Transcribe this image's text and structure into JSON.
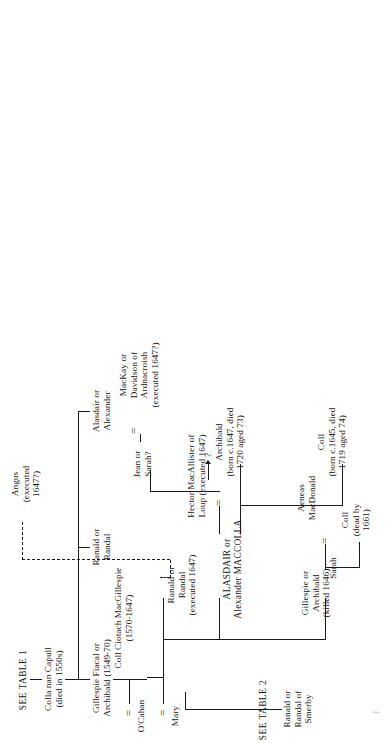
{
  "document": {
    "type": "genealogy-table",
    "title": "MacColla / MacDonald of Colonsay family tree",
    "orientation": "rotated-90-ccw",
    "ink_color": "#1a1a1a",
    "paper_color": "#ffffff"
  },
  "refs": {
    "table1": "SEE TABLE 1",
    "table2": "SEE TABLE 2"
  },
  "people": {
    "colla_nan_capull": "Colla nan Capull\n(died in 1550s)",
    "alasdair_alexander": "Alasdair or\nAlexander",
    "ranald_randal": "Ranald or\nRandal",
    "gillespie_fiacal": "Gillespie Fiacal or\nArchibald (1549-70)",
    "coll_ciotach": "Coll Ciotach MacGillespie\n(1570-1647)",
    "ocahan": "O'Cahan",
    "mary": "Mary",
    "ranald_randal_smerby": "Ranald or\nRandal of\nSmerby",
    "ranald_randal_executed": "Ranald or\nRandal\n(executed 1647)",
    "alasdair_maccolla": "ALASDAIR or\nAlexander MACCOLLA",
    "gillespie_archibald_killed": "Gillespie or\nArchibald\n(killed 1646)",
    "hector_macallister": "Hector MacAllister of\nLoup (executed 1647)",
    "jean_or_sarah": "Jean or\nSarah?",
    "mackay_davidson": "MacKay or\nDavidson of\nArdnacroish\n(executed 1647?)",
    "angus": "Angus\n(executed\n1647?)",
    "unknown_child": "?",
    "archibald_1647": "Archibald\n(born c.1647, died\n1720 aged 73)",
    "coll_1645": "Coll\n(born c.1645, died\n1719 aged 74)",
    "sarah": "Sarah",
    "aeneas_macdonald": "Aeneas\nMacDonald",
    "coll_dead_1661": "Coll\n(dead by\n1661)"
  },
  "marriage_marks": {
    "ocahan_gillespie": "=",
    "mary_coll": "=",
    "hector_jean": "=",
    "jean_mackay": "=",
    "sarah_aeneas": "="
  },
  "speck": "J"
}
